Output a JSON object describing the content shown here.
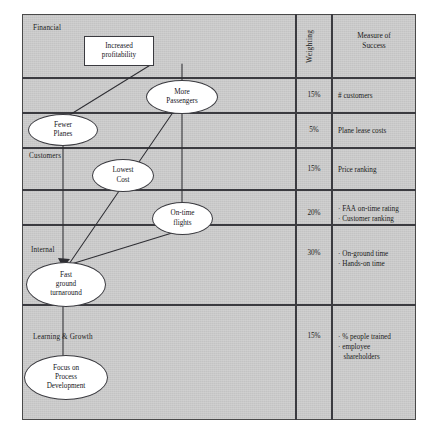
{
  "diagram": {
    "panel_color": "#c9c9c9",
    "line_color": "#3b3b40",
    "node_fill": "#ffffff"
  },
  "perspectives": [
    {
      "key": "financial",
      "label": "Financial"
    },
    {
      "key": "customers",
      "label": "Customers"
    },
    {
      "key": "internal",
      "label": "Internal"
    },
    {
      "key": "learning",
      "label": "Learning & Growth"
    }
  ],
  "nodes": [
    {
      "key": "increased_profitability",
      "label": "Increased\nprofitability",
      "shape": "rect"
    },
    {
      "key": "more_passengers",
      "label": "More\nPassengers",
      "shape": "ellipse"
    },
    {
      "key": "fewer_planes",
      "label": "Fewer\nPlanes",
      "shape": "ellipse"
    },
    {
      "key": "lowest_cost",
      "label": "Lowest\nCost",
      "shape": "ellipse"
    },
    {
      "key": "on_time_flights",
      "label": "On-time\nflights",
      "shape": "ellipse"
    },
    {
      "key": "fast_ground_turnaround",
      "label": "Fast\nground\nturnaround",
      "shape": "ellipse"
    },
    {
      "key": "focus_on_process_development",
      "label": "Focus on\nProcess\nDevelopment",
      "shape": "ellipse"
    }
  ],
  "columns": {
    "weighting_header": "Weighting",
    "measure_header": "Measure of\nSuccess"
  },
  "rows": [
    {
      "weighting": "15%",
      "measure": "# customers"
    },
    {
      "weighting": "5%",
      "measure": "Plane lease costs"
    },
    {
      "weighting": "15%",
      "measure": "Price ranking"
    },
    {
      "weighting": "20%",
      "measure": "· FAA on-time rating\n· Customer ranking"
    },
    {
      "weighting": "30%",
      "measure": "· On-ground time\n· Hands-on time"
    },
    {
      "weighting": "15%",
      "measure": "· % people trained\n· employee\n   shareholders"
    }
  ]
}
